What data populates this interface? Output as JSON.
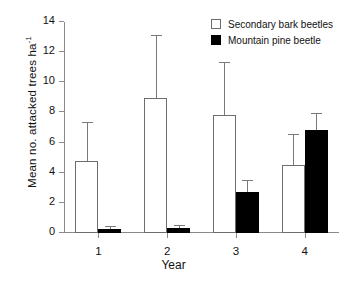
{
  "chart_data": {
    "type": "bar",
    "title": "",
    "xlabel": "Year",
    "ylabel": "Mean no. attacked  trees ha-1",
    "ylabel_base": "Mean no. attacked  trees ha",
    "ylabel_exponent": "-1",
    "categories": [
      "1",
      "2",
      "3",
      "4"
    ],
    "ylim": [
      0,
      14
    ],
    "yticks": [
      0,
      2,
      4,
      6,
      8,
      10,
      12,
      14
    ],
    "ytick_labels": [
      "0",
      "2",
      "4",
      "6",
      "8",
      "10",
      "12",
      "14"
    ],
    "grid": false,
    "legend_position": "top-right",
    "series": [
      {
        "name": "Secondary bark beetles",
        "style": "open",
        "color": "#ffffff",
        "edge_color": "#6d6d6d",
        "values": [
          4.8,
          8.95,
          7.85,
          4.5
        ],
        "error_upper": [
          7.3,
          13.1,
          11.25,
          6.5
        ]
      },
      {
        "name": "Mountain pine beetle",
        "style": "filled",
        "color": "#000000",
        "edge_color": "#000000",
        "values": [
          0.25,
          0.3,
          2.7,
          6.85
        ],
        "error_upper": [
          0.4,
          0.45,
          3.45,
          7.9
        ]
      }
    ]
  },
  "legend": {
    "items": [
      {
        "label": "Secondary bark beetles",
        "style": "open"
      },
      {
        "label": "Mountain pine beetle",
        "style": "filled"
      }
    ]
  }
}
